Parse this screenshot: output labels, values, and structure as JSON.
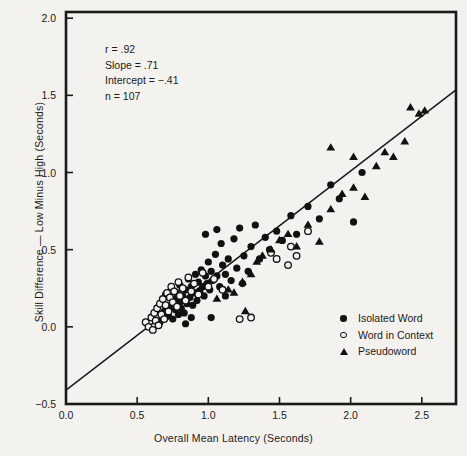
{
  "chart_data": {
    "type": "scatter",
    "title": "",
    "xlabel": "Overall Mean Latency (Seconds)",
    "ylabel": "Skill Difference — Low Minus High (Seconds)",
    "xlim": [
      0.0,
      2.74
    ],
    "ylim": [
      -0.5,
      2.04
    ],
    "xticks": [
      0.0,
      0.5,
      1.0,
      1.5,
      2.0,
      2.5
    ],
    "xtick_labels": [
      "0.0",
      "0.5",
      "1.0",
      "1.5",
      "2.0",
      "2.5"
    ],
    "yticks": [
      -0.5,
      0.0,
      0.5,
      1.0,
      1.5,
      2.0
    ],
    "ytick_labels": [
      "−0.5",
      "0.0",
      "0.5",
      "1.0",
      "1.5",
      "2.0"
    ],
    "grid": false,
    "legend_position": "lower-right",
    "annotations": {
      "r": "r = .92",
      "slope": "Slope = .71",
      "intercept": "Intercept = −.41",
      "n": "n = 107"
    },
    "fit_line": {
      "slope": 0.71,
      "intercept": -0.41,
      "x_start": 0.0,
      "x_end": 2.74
    },
    "series": [
      {
        "name": "Isolated Word",
        "marker": "filled-circle",
        "color": "#111111",
        "points": [
          [
            0.69,
            0.1
          ],
          [
            0.72,
            0.07
          ],
          [
            0.74,
            0.13
          ],
          [
            0.75,
            0.05
          ],
          [
            0.76,
            0.18
          ],
          [
            0.77,
            0.11
          ],
          [
            0.78,
            0.22
          ],
          [
            0.79,
            0.08
          ],
          [
            0.8,
            0.16
          ],
          [
            0.8,
            0.27
          ],
          [
            0.81,
            0.12
          ],
          [
            0.82,
            0.2
          ],
          [
            0.83,
            0.09
          ],
          [
            0.84,
            0.24
          ],
          [
            0.85,
            0.15
          ],
          [
            0.86,
            0.31
          ],
          [
            0.87,
            0.19
          ],
          [
            0.88,
            0.26
          ],
          [
            0.89,
            0.14
          ],
          [
            0.9,
            0.22
          ],
          [
            0.91,
            0.34
          ],
          [
            0.92,
            0.17
          ],
          [
            0.93,
            0.29
          ],
          [
            0.94,
            0.23
          ],
          [
            0.95,
            0.37
          ],
          [
            0.96,
            0.26
          ],
          [
            0.97,
            0.2
          ],
          [
            0.98,
            0.33
          ],
          [
            0.99,
            0.28
          ],
          [
            1.0,
            0.42
          ],
          [
            1.01,
            0.24
          ],
          [
            1.02,
            0.36
          ],
          [
            1.03,
            0.3
          ],
          [
            1.05,
            0.47
          ],
          [
            1.06,
            0.33
          ],
          [
            1.08,
            0.26
          ],
          [
            1.09,
            0.54
          ],
          [
            1.1,
            0.4
          ],
          [
            1.12,
            0.34
          ],
          [
            1.14,
            0.44
          ],
          [
            1.16,
            0.3
          ],
          [
            1.18,
            0.57
          ],
          [
            1.2,
            0.38
          ],
          [
            1.22,
            0.64
          ],
          [
            1.25,
            0.46
          ],
          [
            1.28,
            0.36
          ],
          [
            1.3,
            0.52
          ],
          [
            1.33,
            0.66
          ],
          [
            1.36,
            0.44
          ],
          [
            1.4,
            0.58
          ],
          [
            1.43,
            0.5
          ],
          [
            1.48,
            0.62
          ],
          [
            1.52,
            0.56
          ],
          [
            1.58,
            0.72
          ],
          [
            1.62,
            0.6
          ],
          [
            1.7,
            0.78
          ],
          [
            1.78,
            0.7
          ],
          [
            1.86,
            0.92
          ],
          [
            1.92,
            0.83
          ],
          [
            2.02,
            0.68
          ],
          [
            2.08,
            1.0
          ],
          [
            0.66,
            0.03
          ],
          [
            0.7,
            0.21
          ],
          [
            0.84,
            0.02
          ],
          [
            0.88,
            0.06
          ],
          [
            1.02,
            0.06
          ],
          [
            1.12,
            0.2
          ],
          [
            1.24,
            0.28
          ],
          [
            0.98,
            0.6
          ],
          [
            1.06,
            0.63
          ]
        ]
      },
      {
        "name": "Word in Context",
        "marker": "open-circle",
        "color": "#111111",
        "points": [
          [
            0.56,
            0.03
          ],
          [
            0.58,
            0.0
          ],
          [
            0.6,
            0.06
          ],
          [
            0.61,
            -0.02
          ],
          [
            0.62,
            0.09
          ],
          [
            0.63,
            0.04
          ],
          [
            0.64,
            0.12
          ],
          [
            0.65,
            0.01
          ],
          [
            0.66,
            0.15
          ],
          [
            0.67,
            0.08
          ],
          [
            0.68,
            0.18
          ],
          [
            0.69,
            0.05
          ],
          [
            0.7,
            0.14
          ],
          [
            0.71,
            0.22
          ],
          [
            0.72,
            0.1
          ],
          [
            0.73,
            0.19
          ],
          [
            0.74,
            0.26
          ],
          [
            0.75,
            0.16
          ],
          [
            0.76,
            0.23
          ],
          [
            0.78,
            0.13
          ],
          [
            0.79,
            0.29
          ],
          [
            0.8,
            0.2
          ],
          [
            0.82,
            0.25
          ],
          [
            0.84,
            0.17
          ],
          [
            0.86,
            0.32
          ],
          [
            0.88,
            0.23
          ],
          [
            0.9,
            0.28
          ],
          [
            0.93,
            0.21
          ],
          [
            0.96,
            0.35
          ],
          [
            1.0,
            0.26
          ],
          [
            1.04,
            0.31
          ],
          [
            1.1,
            0.24
          ],
          [
            1.22,
            0.05
          ],
          [
            1.3,
            0.06
          ],
          [
            1.48,
            0.44
          ],
          [
            1.56,
            0.4
          ],
          [
            1.62,
            0.46
          ],
          [
            1.7,
            0.62
          ],
          [
            1.44,
            0.48
          ],
          [
            1.58,
            0.52
          ]
        ]
      },
      {
        "name": "Pseudoword",
        "marker": "triangle",
        "color": "#111111",
        "points": [
          [
            1.06,
            0.18
          ],
          [
            1.14,
            0.24
          ],
          [
            1.18,
            0.22
          ],
          [
            1.24,
            0.29
          ],
          [
            1.3,
            0.34
          ],
          [
            1.34,
            0.42
          ],
          [
            1.38,
            0.46
          ],
          [
            1.44,
            0.5
          ],
          [
            1.5,
            0.56
          ],
          [
            1.56,
            0.6
          ],
          [
            1.62,
            0.52
          ],
          [
            1.7,
            0.66
          ],
          [
            1.78,
            0.55
          ],
          [
            1.86,
            0.76
          ],
          [
            1.94,
            0.86
          ],
          [
            2.02,
            0.9
          ],
          [
            2.1,
            0.84
          ],
          [
            2.18,
            1.04
          ],
          [
            2.24,
            1.13
          ],
          [
            2.3,
            1.1
          ],
          [
            2.38,
            1.2
          ],
          [
            2.42,
            1.42
          ],
          [
            2.48,
            1.38
          ],
          [
            2.52,
            1.4
          ],
          [
            1.26,
            0.1
          ],
          [
            1.86,
            1.16
          ],
          [
            2.02,
            1.1
          ]
        ]
      }
    ]
  }
}
